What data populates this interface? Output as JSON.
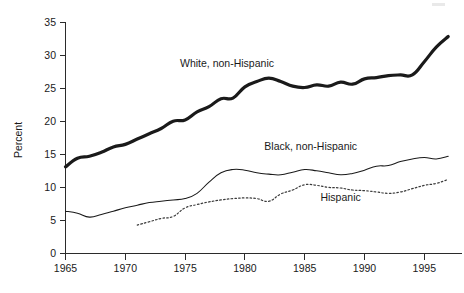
{
  "figure": {
    "width": 464,
    "height": 293,
    "background": "#ffffff",
    "ink_color": "#1a1a1a"
  },
  "axes": {
    "y_title": "Percent",
    "x_tick_labels": [
      "1965",
      "1970",
      "1975",
      "1980",
      "1985",
      "1990",
      "1995"
    ],
    "y_tick_labels": [
      "0",
      "5",
      "10",
      "15",
      "20",
      "25",
      "30",
      "35"
    ]
  },
  "series_labels": {
    "white": "White, non-Hispanic",
    "black": "Black, non-Hispanic",
    "hispanic": "Hispanic"
  },
  "chart_data": {
    "type": "line",
    "title": "",
    "subtitle": "",
    "xlabel": "",
    "ylabel": "Percent",
    "xlim": [
      1965,
      1997
    ],
    "ylim": [
      0,
      35
    ],
    "y_ticks": [
      0,
      5,
      10,
      15,
      20,
      25,
      30,
      35
    ],
    "x_ticks": [
      1965,
      1970,
      1975,
      1980,
      1985,
      1990,
      1995
    ],
    "grid": false,
    "legend": "inline-annotations",
    "x": [
      1965,
      1966,
      1967,
      1968,
      1969,
      1970,
      1971,
      1972,
      1973,
      1974,
      1975,
      1976,
      1977,
      1978,
      1979,
      1980,
      1981,
      1982,
      1983,
      1984,
      1985,
      1986,
      1987,
      1988,
      1989,
      1990,
      1991,
      1992,
      1993,
      1994,
      1995,
      1996,
      1997
    ],
    "series": [
      {
        "name": "White, non-Hispanic",
        "style": "thick-solid",
        "color": "#1a1a1a",
        "label_position": {
          "x": 1978.5,
          "y": 28.2
        },
        "values": [
          13.1,
          14.4,
          14.7,
          15.3,
          16.1,
          16.5,
          17.3,
          18.1,
          18.9,
          20.0,
          20.2,
          21.4,
          22.2,
          23.4,
          23.5,
          25.2,
          26.0,
          26.5,
          26.0,
          25.3,
          25.1,
          25.5,
          25.3,
          25.9,
          25.6,
          26.4,
          26.6,
          26.9,
          27.0,
          27.0,
          29.0,
          31.2,
          32.8
        ]
      },
      {
        "name": "Black, non-Hispanic",
        "style": "thin-solid",
        "color": "#1a1a1a",
        "label_position": {
          "x": 1985.5,
          "y": 15.6
        },
        "values": [
          6.4,
          6.1,
          5.5,
          5.9,
          6.4,
          6.9,
          7.3,
          7.7,
          7.9,
          8.1,
          8.3,
          9.1,
          10.8,
          12.2,
          12.7,
          12.6,
          12.2,
          12.0,
          11.9,
          12.3,
          12.7,
          12.5,
          12.2,
          11.9,
          12.1,
          12.6,
          13.2,
          13.3,
          13.9,
          14.3,
          14.5,
          14.3,
          14.7
        ]
      },
      {
        "name": "Hispanic",
        "style": "dotted",
        "color": "#3a3a3a",
        "label_position": {
          "x": 1988.0,
          "y": 8.0
        },
        "values": [
          null,
          null,
          null,
          null,
          null,
          null,
          4.3,
          4.8,
          5.3,
          5.6,
          6.9,
          7.4,
          7.8,
          8.1,
          8.3,
          8.4,
          8.3,
          7.9,
          9.0,
          9.6,
          10.4,
          10.3,
          10.0,
          9.9,
          9.6,
          9.5,
          9.3,
          9.1,
          9.3,
          9.8,
          10.3,
          10.6,
          11.2
        ]
      }
    ]
  }
}
